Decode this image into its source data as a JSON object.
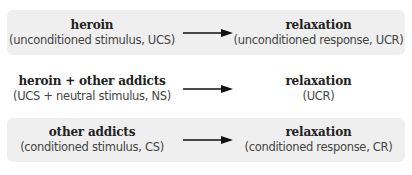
{
  "diagram": {
    "type": "classical-conditioning-flow",
    "rows": [
      {
        "shaded": true,
        "stimulus": {
          "label": "heroin",
          "sublabel": "(unconditioned stimulus, UCS)"
        },
        "arrow_icon": "right-arrow-icon",
        "response": {
          "label": "relaxation",
          "sublabel": "(unconditioned response, UCR)"
        }
      },
      {
        "shaded": false,
        "stimulus": {
          "label": "heroin + other addicts",
          "sublabel": "(UCS + neutral stimulus, NS)"
        },
        "arrow_icon": "right-arrow-icon",
        "response": {
          "label": "relaxation",
          "sublabel": "(UCR)"
        }
      },
      {
        "shaded": true,
        "stimulus": {
          "label": "other addicts",
          "sublabel": "(conditioned stimulus, CS)"
        },
        "arrow_icon": "right-arrow-icon",
        "response": {
          "label": "relaxation",
          "sublabel": "(conditioned response, CR)"
        }
      }
    ]
  },
  "colors": {
    "shaded_row_bg": "#efefef",
    "arrow": "#111111",
    "label_text": "#222222",
    "sublabel_text": "#444444"
  }
}
